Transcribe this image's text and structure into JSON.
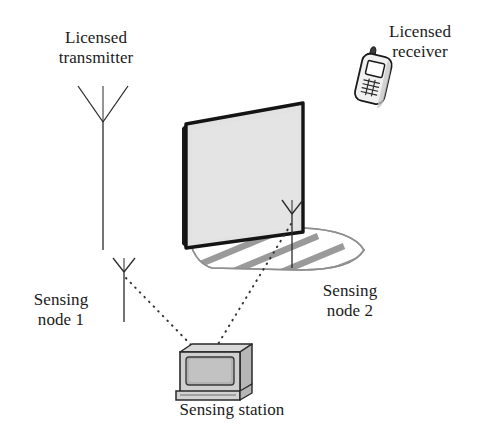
{
  "figure": {
    "background_color": "#ffffff"
  },
  "labels": {
    "licensed_transmitter": "Licensed\ntransmitter",
    "licensed_receiver": "Licensed\nreceiver",
    "sensing_node_1": "Sensing\nnode 1",
    "sensing_node_2": "Sensing\nnode 2",
    "sensing_station": "Sensing station"
  },
  "colors": {
    "stroke": "#1a1a1a",
    "wall_fill": "#e2e2e2",
    "wall_edge": "#111111",
    "shadow_fill": "#ffffff",
    "shadow_stripe": "#a8a8a8",
    "monitor_body": "#c9c9c9",
    "monitor_screen": "#b4b4b4",
    "monitor_top": "#d8d8d8",
    "phone_fill": "#efefef",
    "dotted_link": "#3a3a3a"
  },
  "elements": {
    "licensed_transmitter_antenna": {
      "type": "antenna",
      "mast_x": 103,
      "mast_top": 122,
      "mast_bottom": 250,
      "v_left_x": 78,
      "v_right_x": 128,
      "v_top_y": 86
    },
    "licensed_receiver_phone": {
      "type": "mobile-phone",
      "x": 358,
      "y": 48,
      "width": 34,
      "height": 56,
      "rotation_deg": 12
    },
    "shadowing_wall": {
      "type": "wall-quad",
      "corners": [
        [
          186,
          124
        ],
        [
          303,
          103
        ],
        [
          303,
          232
        ],
        [
          186,
          248
        ]
      ]
    },
    "shadow_region": {
      "type": "hatched-ground-shadow",
      "stripe_count": 7,
      "x_range": [
        188,
        366
      ],
      "y_range": [
        228,
        270
      ]
    },
    "sensing_node_1_antenna": {
      "type": "antenna",
      "mast_x": 124,
      "mast_top": 272,
      "mast_bottom": 322,
      "v_left_x": 113,
      "v_right_x": 135,
      "v_top_y": 258
    },
    "sensing_node_2_antenna": {
      "type": "antenna",
      "mast_x": 292,
      "mast_top": 214,
      "mast_bottom": 268,
      "v_left_x": 282,
      "v_right_x": 303,
      "v_top_y": 200
    },
    "sensing_station_monitor": {
      "type": "crt-monitor",
      "x": 174,
      "y": 344,
      "width": 78,
      "height": 52
    },
    "links": [
      {
        "name": "node1-to-station",
        "from": [
          124,
          277
        ],
        "to": [
          196,
          350
        ],
        "style": "dotted"
      },
      {
        "name": "node2-to-station",
        "from": [
          290,
          225
        ],
        "to": [
          214,
          348
        ],
        "style": "dotted"
      }
    ]
  }
}
